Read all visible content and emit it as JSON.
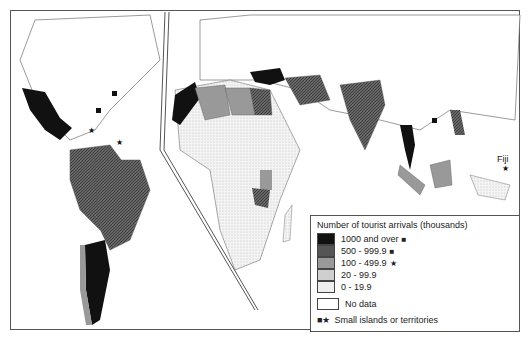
{
  "legend": {
    "title": "Number of tourist arrivals (thousands)",
    "categories": [
      {
        "label": "1000 and over",
        "marker": "■",
        "color": "#111111"
      },
      {
        "label": "500 - 999.9",
        "marker": "■",
        "color": "#555555"
      },
      {
        "label": "100 - 499.9",
        "marker": "★",
        "color": "#999999"
      },
      {
        "label": "20 - 99.9",
        "marker": "",
        "color": "#cfcfcf"
      },
      {
        "label": "0 - 19.9",
        "marker": "",
        "color": "#eeeeee"
      }
    ],
    "no_data": "No data",
    "islands": {
      "markers": "■★",
      "label": "Small islands or territories"
    }
  },
  "labels": {
    "fiji": "Fiji"
  }
}
